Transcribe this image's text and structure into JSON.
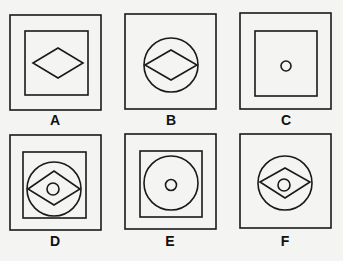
{
  "figure": {
    "stroke_color": "#1a1a1a",
    "background": "#f4f4f2",
    "options": [
      {
        "label": "A",
        "elements": [
          "outer-square",
          "inner-square",
          "diamond"
        ]
      },
      {
        "label": "B",
        "elements": [
          "outer-square",
          "circle",
          "diamond"
        ]
      },
      {
        "label": "C",
        "elements": [
          "outer-square",
          "inner-square",
          "small-circle"
        ]
      },
      {
        "label": "D",
        "elements": [
          "outer-square",
          "inner-square",
          "circle",
          "diamond",
          "small-circle"
        ]
      },
      {
        "label": "E",
        "elements": [
          "outer-square",
          "inner-square",
          "circle",
          "small-circle"
        ]
      },
      {
        "label": "F",
        "elements": [
          "outer-square",
          "circle",
          "diamond",
          "small-circle"
        ]
      }
    ]
  }
}
